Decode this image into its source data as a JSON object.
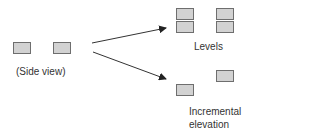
{
  "diagram": {
    "colors": {
      "box_fill": "#d2d2d2",
      "box_border": "#6e6e6e",
      "arrow": "#333333",
      "text": "#333333"
    },
    "side_view": {
      "label": "(Side view)",
      "boxes": [
        {
          "x": 13,
          "y": 42
        },
        {
          "x": 53,
          "y": 42
        }
      ]
    },
    "levels": {
      "label": "Levels",
      "boxes": [
        {
          "x": 176,
          "y": 8
        },
        {
          "x": 176,
          "y": 21
        },
        {
          "x": 216,
          "y": 8
        },
        {
          "x": 216,
          "y": 21
        }
      ]
    },
    "incremental": {
      "label_line1": "Incremental",
      "label_line2": "elevation",
      "boxes": [
        {
          "x": 176,
          "y": 84
        },
        {
          "x": 216,
          "y": 70
        }
      ]
    },
    "arrows": [
      {
        "name": "to-levels",
        "x1": 92,
        "y1": 43,
        "x2": 166,
        "y2": 28
      },
      {
        "name": "to-incremental",
        "x1": 93,
        "y1": 52,
        "x2": 166,
        "y2": 79
      }
    ]
  }
}
